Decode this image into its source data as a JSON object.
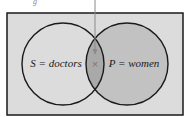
{
  "diagram": {
    "type": "venn",
    "top_caption_fragment": "g",
    "sets": [
      {
        "id": "S",
        "label": "S = doctors",
        "fill": "#dcdcdc"
      },
      {
        "id": "P",
        "label": "P = women",
        "fill": "#c2c2c2"
      }
    ],
    "intersection": {
      "marker": "×",
      "fill": "#a9a9a9"
    },
    "colors": {
      "universe": "#dcdcdc",
      "stroke": "#1a1a1a",
      "arrow": "#8a8a8a"
    }
  }
}
